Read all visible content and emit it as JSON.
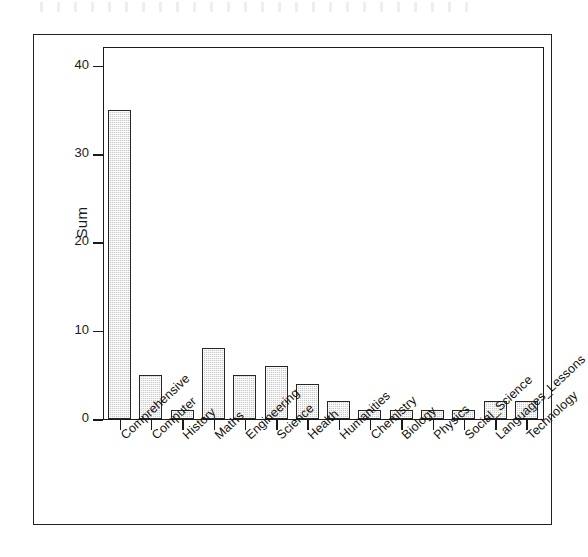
{
  "chart_data": {
    "type": "bar",
    "title": "",
    "subtitle": "",
    "xlabel": "",
    "ylabel": "Sum",
    "ylim": [
      0,
      42
    ],
    "yticks": [
      0,
      10,
      20,
      30,
      40
    ],
    "ytick_labels": [
      "0",
      "10",
      "20",
      "30",
      "40"
    ],
    "grid": false,
    "legend": false,
    "orientation": "vertical",
    "bar_fill_color": "#c9c9c9",
    "bar_border_color": "#262626",
    "axis_color": "#1a1a1a",
    "categories": [
      "Comprehensive",
      "Computer",
      "History",
      "Maths",
      "Engineering",
      "Science",
      "Health",
      "Humanities",
      "Chemistry",
      "Biology",
      "Physics",
      "Social_Science",
      "Languages_Lessons",
      "Technology"
    ],
    "values": [
      35,
      5,
      1,
      8,
      5,
      6,
      4,
      2,
      1,
      1,
      1,
      1,
      2,
      2
    ],
    "series": [
      {
        "name": "Sum",
        "values": [
          35,
          5,
          1,
          8,
          5,
          6,
          4,
          2,
          1,
          1,
          1,
          1,
          2,
          2
        ]
      }
    ]
  },
  "axes": {
    "y_title": "Sum",
    "y_ticks": [
      {
        "label": "40",
        "value": 40
      },
      {
        "label": "30",
        "value": 30
      },
      {
        "label": "20",
        "value": 20
      },
      {
        "label": "10",
        "value": 10
      },
      {
        "label": "0",
        "value": 0
      }
    ]
  }
}
